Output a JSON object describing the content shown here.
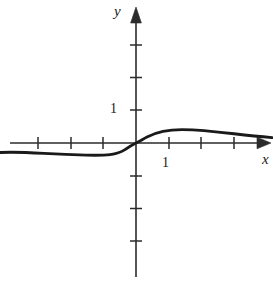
{
  "figure": {
    "background_color": "#ffffff",
    "ink_color": "#2b2b2b",
    "curve_color": "#1a1a1a",
    "width": 273,
    "height": 285
  },
  "axes": {
    "x_axis_label": "x",
    "y_axis_label": "y",
    "x_tick_label": "1",
    "y_tick_label": "1",
    "origin_px": {
      "x": 136,
      "y": 143
    },
    "unit_px": 32.7,
    "x_range": [
      -4.2,
      4.1
    ],
    "y_range": [
      -4.1,
      4.1
    ],
    "x_ticks": [
      -3,
      -2,
      -1,
      1,
      2,
      3
    ],
    "y_ticks": [
      -3,
      -2,
      -1,
      1,
      2,
      3
    ],
    "x_labeled_ticks": [
      1
    ],
    "y_labeled_ticks": [
      1
    ],
    "grid": "off",
    "arrows": [
      "x-positive",
      "y-positive"
    ]
  },
  "chart_data": {
    "type": "line",
    "title": "",
    "subtitle": "",
    "xlabel": "x",
    "ylabel": "y",
    "xlim": [
      -4.2,
      4.1
    ],
    "ylim": [
      -4.1,
      4.1
    ],
    "grid": false,
    "legend": "none",
    "annotations": [],
    "series": [
      {
        "name": "curve",
        "description": "odd, S-shaped curve through the origin with a local minimum near x = -1.3, a steep rise through the origin, a local maximum near x = 1.5 at about y = 0.4, then a slow decay toward zero",
        "x": [
          -4.15,
          -3.8,
          -3.4,
          -3.0,
          -2.6,
          -2.2,
          -1.9,
          -1.6,
          -1.25,
          -1.0,
          -0.8,
          -0.6,
          -0.4,
          -0.2,
          0.0,
          0.2,
          0.4,
          0.6,
          0.8,
          1.0,
          1.2,
          1.45,
          1.7,
          2.0,
          2.3,
          2.7,
          3.1,
          3.5,
          3.9,
          4.1
        ],
        "y": [
          -0.27,
          -0.3,
          -0.33,
          -0.35,
          -0.36,
          -0.37,
          -0.37,
          -0.37,
          -0.365,
          -0.35,
          -0.31,
          -0.25,
          -0.17,
          -0.08,
          0.0,
          0.09,
          0.19,
          0.27,
          0.33,
          0.37,
          0.39,
          0.4,
          0.39,
          0.38,
          0.36,
          0.33,
          0.3,
          0.26,
          0.22,
          0.2
        ]
      }
    ]
  },
  "curve_path": "M 0,152.5 C 14,151.8 30,152.6 44,153.4 C 58,154.2 72,154.8 86,155.1 C 96,155.3 104,155.3 110,154.6 C 116,153.9 121,152.3 125,149.6 C 129,146.9 132,145.0 136,143.0 C 140,141.0 143,139.1 147,137.0 C 152,134.4 157,132.5 163,131.3 C 169,130.2 175,129.7 182,129.6 C 190,129.6 197,130.0 204,130.6 C 214,131.5 224,132.6 234,133.8 C 246,135.2 258,136.5 272,137.6",
  "axis_paths": {
    "x_axis_line": "M 10,143 L 263,143",
    "y_axis_line": "M 136,277 L 136,14",
    "x_arrow": "M 258,137.5 L 271,143 L 258,148.5 Z",
    "y_arrow": "M 130.5,22 L 136,7 L 141.5,22 Z"
  },
  "tick_marks": {
    "x_positions_px": [
      38,
      71,
      103,
      169,
      201,
      234
    ],
    "y_positions_px": [
      45,
      77.5,
      110,
      176,
      208.5,
      241
    ],
    "x_tick_half_len": 6,
    "y_tick_half_len": 6
  }
}
